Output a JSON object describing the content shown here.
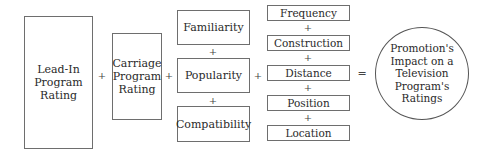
{
  "diagram": {
    "lead_in": "Lead-In\nProgram\nRating",
    "carriage": "Carriage\nProgram\nRating",
    "middle": [
      "Familiarity",
      "Popularity",
      "Compatibility"
    ],
    "right": [
      "Frequency",
      "Construction",
      "Distance",
      "Position",
      "Location"
    ],
    "result": "Promotion's\nImpact on a\nTelevision\nProgram's\nRatings",
    "plus": "+",
    "equals": "="
  }
}
